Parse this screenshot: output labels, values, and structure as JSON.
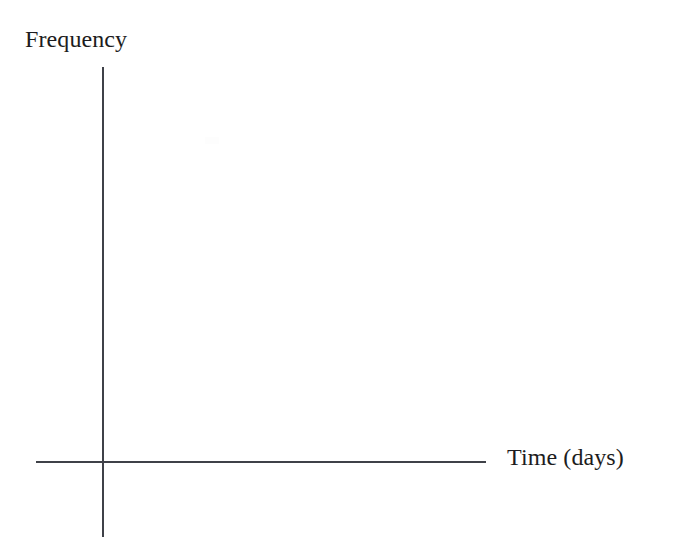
{
  "figure": {
    "kind": "blank-axes-diagram",
    "background_color": "#ffffff",
    "axis_color": "#3f4148",
    "text_color": "#1c1c20",
    "width": 679,
    "height": 549
  },
  "chart_data": {
    "type": "line",
    "title": "",
    "subtitle": "",
    "xlabel": "Time (days)",
    "ylabel": "Frequency",
    "x": [],
    "values": [],
    "series": [],
    "categories": [],
    "tick_labels": {
      "x": [],
      "y": []
    },
    "xlim": null,
    "ylim": null,
    "grid": false,
    "legend": false,
    "legend_position": "none",
    "annotations": []
  },
  "labels": {
    "y_axis": "Frequency",
    "x_axis": "Time (days)"
  }
}
